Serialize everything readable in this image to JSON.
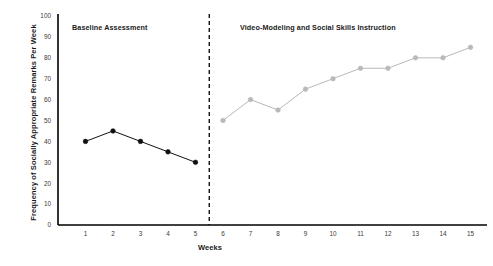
{
  "chart_data": {
    "type": "line",
    "title": "",
    "xlabel": "Weeks",
    "ylabel": "Frequency of Socially Appropriate Remarks Per Week",
    "xlim": [
      0,
      15.6
    ],
    "ylim": [
      0,
      100
    ],
    "yticks": [
      0,
      10,
      20,
      30,
      40,
      50,
      60,
      70,
      80,
      90,
      100
    ],
    "xticks": [
      1,
      2,
      3,
      4,
      5,
      6,
      7,
      8,
      9,
      10,
      11,
      12,
      13,
      14,
      15
    ],
    "grid": false,
    "legend": "none",
    "x": [
      1,
      2,
      3,
      4,
      5,
      6,
      7,
      8,
      9,
      10,
      11,
      12,
      13,
      14,
      15
    ],
    "series": [
      {
        "name": "Baseline Assessment",
        "color": "#111111",
        "x": [
          1,
          2,
          3,
          4,
          5
        ],
        "values": [
          40,
          45,
          40,
          35,
          30
        ]
      },
      {
        "name": "Video-Modeling and Social Skills Instruction",
        "color": "#b9b9b9",
        "x": [
          6,
          7,
          8,
          9,
          10,
          11,
          12,
          13,
          14,
          15
        ],
        "values": [
          50,
          60,
          55,
          65,
          70,
          75,
          75,
          80,
          80,
          85
        ]
      }
    ],
    "annotations": [
      {
        "type": "phase-label",
        "text": "Baseline Assessment",
        "x": 2.5
      },
      {
        "type": "phase-label",
        "text": "Video-Modeling and Social Skills Instruction",
        "x": 10.5
      },
      {
        "type": "phase-line",
        "style": "dashed",
        "x": 5.5
      }
    ]
  },
  "axis": {
    "x_title": "Weeks",
    "y_title": "Frequency of Socially Appropriate Remarks Per Week"
  },
  "colors": {
    "baseline": "#111111",
    "intervention": "#b9b9b9",
    "axis": "#000000",
    "background": "#ffffff"
  }
}
